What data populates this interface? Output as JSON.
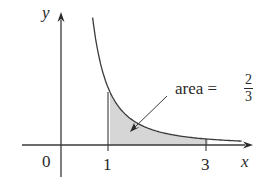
{
  "figure": {
    "function": "y = 1/x^2",
    "axis_labels": {
      "x": "x",
      "y": "y"
    },
    "tick_labels": {
      "origin": "0",
      "x1": "1",
      "x3": "3"
    },
    "annotation": {
      "text": "area =",
      "numerator": "2",
      "denominator": "3"
    },
    "shaded_region": {
      "from": 1,
      "to": 3
    },
    "colors": {
      "curve": "#3a3a3a",
      "shade": "#d4d4d4",
      "axis": "#3a3a3a"
    }
  }
}
